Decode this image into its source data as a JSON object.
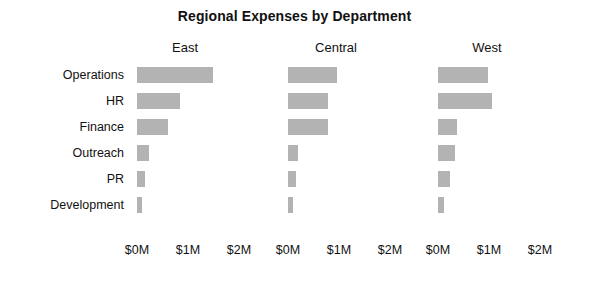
{
  "chart_data": {
    "type": "bar",
    "orientation": "horizontal",
    "title": "Regional Expenses by Department",
    "xlabel": "",
    "ylabel": "",
    "categories": [
      "Operations",
      "HR",
      "Finance",
      "Outreach",
      "PR",
      "Development"
    ],
    "panels": [
      "East",
      "Central",
      "West"
    ],
    "series": [
      {
        "name": "East",
        "values": [
          1.49,
          0.85,
          0.61,
          0.23,
          0.16,
          0.1
        ]
      },
      {
        "name": "Central",
        "values": [
          0.96,
          0.78,
          0.78,
          0.2,
          0.16,
          0.1
        ]
      },
      {
        "name": "West",
        "values": [
          0.98,
          1.06,
          0.38,
          0.33,
          0.23,
          0.12
        ]
      }
    ],
    "units": "millions of dollars",
    "xlim": [
      0,
      2.3
    ],
    "xticks": [
      0,
      1,
      2
    ],
    "xtick_labels": [
      "$0M",
      "$1M",
      "$2M"
    ],
    "grid": false,
    "legend": "none",
    "bar_color": "#b3b3b3",
    "background_color": "#ffffff",
    "text_color": "#111111"
  },
  "panel_titles": [
    "East",
    "Central",
    "West"
  ],
  "row_labels": [
    "Operations",
    "HR",
    "Finance",
    "Outreach",
    "PR",
    "Development"
  ],
  "axis_tick_labels": [
    "$0M",
    "$1M",
    "$2M"
  ]
}
